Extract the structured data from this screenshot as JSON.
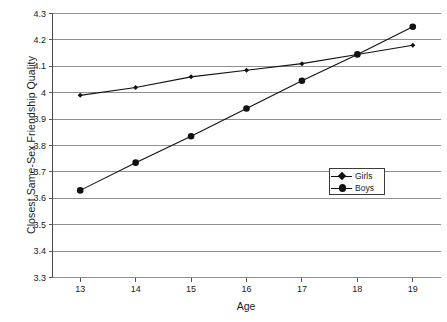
{
  "chart_data": {
    "type": "line",
    "title": "",
    "xlabel": "Age",
    "ylabel": "Closest Same-Sex Friendship Quality",
    "x": [
      13,
      14,
      15,
      16,
      17,
      18,
      19
    ],
    "xtick_labels": [
      "13",
      "14",
      "15",
      "16",
      "17",
      "18",
      "19"
    ],
    "xlim": [
      12.5,
      19.5
    ],
    "ylim": [
      3.3,
      4.3
    ],
    "ytick_labels": [
      "3.3",
      "3.4",
      "3.5",
      "3.6",
      "3.7",
      "3.8",
      "3.9",
      "4",
      "4.1",
      "4.2",
      "4.3"
    ],
    "ytick_values": [
      3.3,
      3.4,
      3.5,
      3.6,
      3.7,
      3.8,
      3.9,
      4.0,
      4.1,
      4.2,
      4.3
    ],
    "grid": "horizontal",
    "legend_position": "inside-right",
    "series": [
      {
        "name": "Girls",
        "marker": "diamond",
        "color": "#111111",
        "values": [
          3.99,
          4.02,
          4.06,
          4.085,
          4.11,
          4.145,
          4.18
        ]
      },
      {
        "name": "Boys",
        "marker": "circle",
        "color": "#111111",
        "values": [
          3.63,
          3.735,
          3.835,
          3.94,
          4.045,
          4.145,
          4.25
        ]
      }
    ]
  },
  "legend": {
    "entries": [
      {
        "label": "Girls"
      },
      {
        "label": "Boys"
      }
    ]
  }
}
